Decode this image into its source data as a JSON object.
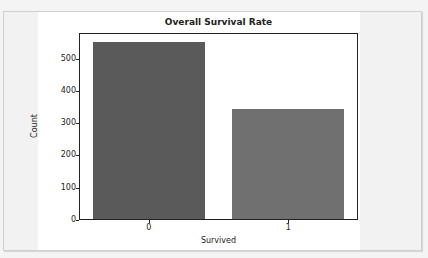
{
  "chart_data": {
    "type": "bar",
    "title": "Overall Survival Rate",
    "xlabel": "Survived",
    "ylabel": "Count",
    "categories": [
      "0",
      "1"
    ],
    "values": [
      549,
      342
    ],
    "colors": [
      "#5a5a5a",
      "#707070"
    ],
    "ylim": [
      0,
      580
    ],
    "yticks": [
      0,
      100,
      200,
      300,
      400,
      500
    ],
    "ytick_labels": [
      "0",
      "100",
      "200",
      "300",
      "400",
      "500"
    ],
    "grid": false,
    "legend": null
  }
}
